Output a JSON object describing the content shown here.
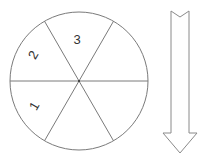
{
  "diagram": {
    "type": "spinner-with-arrow",
    "spinner": {
      "sections": 6,
      "labels": [
        {
          "text": "1",
          "sector": "lower-left"
        },
        {
          "text": "2",
          "sector": "upper-left"
        },
        {
          "text": "3",
          "sector": "top"
        }
      ],
      "stroke_color": "#7a7a7a"
    },
    "arrow": {
      "direction": "down",
      "stroke_color": "#8a8a8a"
    }
  }
}
